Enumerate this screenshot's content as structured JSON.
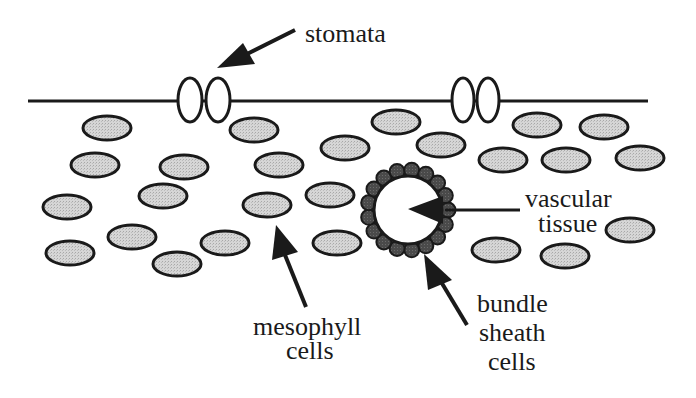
{
  "diagram": {
    "type": "leaf-cross-section",
    "labels": {
      "stomata": "stomata",
      "vascular_line1": "vascular",
      "vascular_line2": "tissue",
      "mesophyll_line1": "mesophyll",
      "mesophyll_line2": "cells",
      "bundle_line1": "bundle",
      "bundle_line2": "sheath",
      "bundle_line3": "cells"
    },
    "colors": {
      "stroke": "#1a1a1a",
      "mesophyll_fill": "#d4d4d4",
      "bundle_sheath_fill": "#4a4a4a",
      "background": "#ffffff"
    },
    "epidermis_line": {
      "x1": 28,
      "x2": 648,
      "y": 101
    },
    "stomata": [
      {
        "cx": 190,
        "cy": 100
      },
      {
        "cx": 218,
        "cy": 100
      },
      {
        "cx": 463,
        "cy": 100
      },
      {
        "cx": 488,
        "cy": 100
      }
    ],
    "mesophyll_cells": [
      [
        107,
        128
      ],
      [
        254,
        130
      ],
      [
        396,
        122
      ],
      [
        537,
        125
      ],
      [
        604,
        127
      ],
      [
        95,
        165
      ],
      [
        184,
        167
      ],
      [
        279,
        165
      ],
      [
        345,
        148
      ],
      [
        441,
        145
      ],
      [
        503,
        160
      ],
      [
        566,
        160
      ],
      [
        640,
        158
      ],
      [
        67,
        207
      ],
      [
        163,
        196
      ],
      [
        267,
        205
      ],
      [
        330,
        195
      ],
      [
        630,
        230
      ],
      [
        70,
        253
      ],
      [
        132,
        237
      ],
      [
        177,
        264
      ],
      [
        225,
        243
      ],
      [
        337,
        243
      ],
      [
        496,
        250
      ],
      [
        565,
        256
      ]
    ],
    "vascular_bundle": {
      "cx": 408,
      "cy": 210,
      "r": 36
    }
  }
}
